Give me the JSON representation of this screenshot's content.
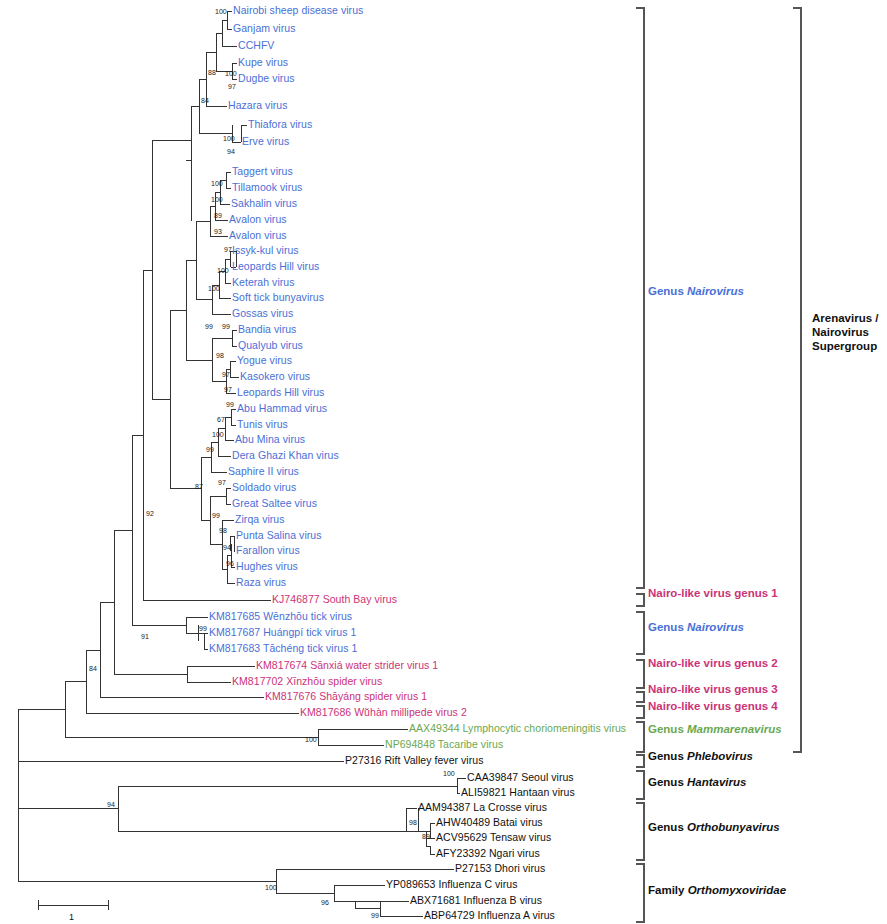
{
  "figure": {
    "type": "phylogenetic-tree",
    "scale_bar": {
      "label": "1",
      "x": 38,
      "y": 905,
      "width": 70
    }
  },
  "colors": {
    "nairovirus_blue": "#4a6fd6",
    "nairo_like_pink": "#cc3377",
    "mammarenavirus_green": "#6aa84f",
    "black": "#111111",
    "branch": "#333333",
    "bracket": "#555555"
  },
  "taxa": [
    {
      "label": "Nairobi sheep disease virus",
      "color": "nairovirus_blue",
      "x": 233,
      "y": 11
    },
    {
      "label": "Ganjam virus",
      "color": "nairovirus_blue",
      "x": 233,
      "y": 29
    },
    {
      "label": "CCHFV",
      "color": "nairovirus_blue",
      "x": 238,
      "y": 46
    },
    {
      "label": "Kupe virus",
      "color": "nairovirus_blue",
      "x": 238,
      "y": 63
    },
    {
      "label": "Dugbe virus",
      "color": "nairovirus_blue",
      "x": 238,
      "y": 79
    },
    {
      "label": "Hazara virus",
      "color": "nairovirus_blue",
      "x": 228,
      "y": 106
    },
    {
      "label": "Thiafora virus",
      "color": "nairovirus_blue",
      "x": 248,
      "y": 125
    },
    {
      "label": "Erve virus",
      "color": "nairovirus_blue",
      "x": 242,
      "y": 142
    },
    {
      "label": "Taggert virus",
      "color": "nairovirus_blue",
      "x": 232,
      "y": 172
    },
    {
      "label": "Tillamook virus",
      "color": "nairovirus_blue",
      "x": 232,
      "y": 188
    },
    {
      "label": "Sakhalin virus",
      "color": "nairovirus_blue",
      "x": 231,
      "y": 204
    },
    {
      "label": "Avalon virus",
      "color": "nairovirus_blue",
      "x": 229,
      "y": 220
    },
    {
      "label": "Avalon virus",
      "color": "nairovirus_blue",
      "x": 229,
      "y": 236
    },
    {
      "label": "Issyk-kul virus",
      "color": "nairovirus_blue",
      "x": 232,
      "y": 251
    },
    {
      "label": "Leopards Hill virus",
      "color": "nairovirus_blue",
      "x": 232,
      "y": 267
    },
    {
      "label": "Keterah virus",
      "color": "nairovirus_blue",
      "x": 232,
      "y": 283
    },
    {
      "label": "Soft tick bunyavirus",
      "color": "nairovirus_blue",
      "x": 232,
      "y": 298
    },
    {
      "label": "Gossas virus",
      "color": "nairovirus_blue",
      "x": 232,
      "y": 314
    },
    {
      "label": "Bandia virus",
      "color": "nairovirus_blue",
      "x": 238,
      "y": 330
    },
    {
      "label": "Qualyub virus",
      "color": "nairovirus_blue",
      "x": 238,
      "y": 346
    },
    {
      "label": "Yogue virus",
      "color": "nairovirus_blue",
      "x": 237,
      "y": 361
    },
    {
      "label": "Kasokero virus",
      "color": "nairovirus_blue",
      "x": 240,
      "y": 377
    },
    {
      "label": "Leopards Hill virus",
      "color": "nairovirus_blue",
      "x": 237,
      "y": 393
    },
    {
      "label": "Abu Hammad virus",
      "color": "nairovirus_blue",
      "x": 237,
      "y": 409
    },
    {
      "label": "Tunis virus",
      "color": "nairovirus_blue",
      "x": 237,
      "y": 425
    },
    {
      "label": "Abu Mina virus",
      "color": "nairovirus_blue",
      "x": 235,
      "y": 440
    },
    {
      "label": "Dera Ghazi Khan virus",
      "color": "nairovirus_blue",
      "x": 232,
      "y": 456
    },
    {
      "label": "Saphire II virus",
      "color": "nairovirus_blue",
      "x": 228,
      "y": 472
    },
    {
      "label": "Soldado virus",
      "color": "nairovirus_blue",
      "x": 232,
      "y": 488
    },
    {
      "label": "Great Saltee virus",
      "color": "nairovirus_blue",
      "x": 232,
      "y": 504
    },
    {
      "label": "Zirqa virus",
      "color": "nairovirus_blue",
      "x": 235,
      "y": 520
    },
    {
      "label": "Punta Salina virus",
      "color": "nairovirus_blue",
      "x": 236,
      "y": 536
    },
    {
      "label": "Farallon virus",
      "color": "nairovirus_blue",
      "x": 236,
      "y": 551
    },
    {
      "label": "Hughes virus",
      "color": "nairovirus_blue",
      "x": 236,
      "y": 567
    },
    {
      "label": "Raza virus",
      "color": "nairovirus_blue",
      "x": 236,
      "y": 583
    },
    {
      "label": "KJ746877 South Bay virus",
      "color": "nairo_like_pink",
      "x": 272,
      "y": 600
    },
    {
      "label": "KM817685 Wēnzhōu tick virus",
      "color": "nairovirus_blue",
      "x": 209,
      "y": 617
    },
    {
      "label": "KM817687 Huángpí tick virus 1",
      "color": "nairovirus_blue",
      "x": 209,
      "y": 633
    },
    {
      "label": "KM817683 Tāchéng tick virus 1",
      "color": "nairovirus_blue",
      "x": 209,
      "y": 649
    },
    {
      "label": "KM817674 Sānxiá water strider virus 1",
      "color": "nairo_like_pink",
      "x": 256,
      "y": 666
    },
    {
      "label": "KM817702 Xīnzhōu spider virus",
      "color": "nairo_like_pink",
      "x": 232,
      "y": 682
    },
    {
      "label": "KM817676 Shāyáng spider virus 1",
      "color": "nairo_like_pink",
      "x": 265,
      "y": 697
    },
    {
      "label": "KM817686 Wŭhàn millipede virus 2",
      "color": "nairo_like_pink",
      "x": 300,
      "y": 713
    },
    {
      "label": "AAX49344 Lymphocytic choriomeningitis virus",
      "color": "mammarenavirus_green",
      "x": 409,
      "y": 729
    },
    {
      "label": "NP694848 Tacaribe virus",
      "color": "mammarenavirus_green",
      "x": 385,
      "y": 745
    },
    {
      "label": "P27316 Rift Valley fever virus",
      "color": "black",
      "x": 345,
      "y": 761
    },
    {
      "label": "CAA39847 Seoul virus",
      "color": "black",
      "x": 467,
      "y": 778
    },
    {
      "label": "ALI59821 Hantaan virus",
      "color": "black",
      "x": 461,
      "y": 793
    },
    {
      "label": "AAM94387 La Crosse virus",
      "color": "black",
      "x": 418,
      "y": 808
    },
    {
      "label": "AHW40489 Batai virus",
      "color": "black",
      "x": 436,
      "y": 823
    },
    {
      "label": "ACV95629 Tensaw virus",
      "color": "black",
      "x": 436,
      "y": 838
    },
    {
      "label": "AFY23392 Ngari virus",
      "color": "black",
      "x": 436,
      "y": 854
    },
    {
      "label": "P27153 Dhori virus",
      "color": "black",
      "x": 455,
      "y": 869
    },
    {
      "label": "YP089653 Influenza C virus",
      "color": "black",
      "x": 386,
      "y": 885
    },
    {
      "label": "ABX71681 Influenza B virus",
      "color": "black",
      "x": 410,
      "y": 901
    },
    {
      "label": "ABP64729 Influenza A virus",
      "color": "black",
      "x": 424,
      "y": 916
    }
  ],
  "bootstrap_values": [
    {
      "value": "100",
      "x": 215,
      "y": 12
    },
    {
      "value": "88",
      "x": 208,
      "y": 73
    },
    {
      "value": "100",
      "x": 225,
      "y": 74
    },
    {
      "value": "97",
      "x": 228,
      "y": 87
    },
    {
      "value": "84",
      "x": 201,
      "y": 101
    },
    {
      "value": "100",
      "x": 223,
      "y": 139
    },
    {
      "value": "94",
      "x": 227,
      "y": 152
    },
    {
      "value": "100",
      "x": 211,
      "y": 184
    },
    {
      "value": "100",
      "x": 211,
      "y": 200
    },
    {
      "value": "89",
      "x": 214,
      "y": 216
    },
    {
      "value": "93",
      "x": 214,
      "y": 232
    },
    {
      "value": "97",
      "x": 224,
      "y": 250
    },
    {
      "value": "100",
      "x": 217,
      "y": 271
    },
    {
      "value": "100",
      "x": 208,
      "y": 289
    },
    {
      "value": "99",
      "x": 205,
      "y": 327
    },
    {
      "value": "99",
      "x": 222,
      "y": 327
    },
    {
      "value": "98",
      "x": 216,
      "y": 356
    },
    {
      "value": "97",
      "x": 222,
      "y": 375
    },
    {
      "value": "97",
      "x": 224,
      "y": 390
    },
    {
      "value": "99",
      "x": 226,
      "y": 405
    },
    {
      "value": "67",
      "x": 217,
      "y": 420
    },
    {
      "value": "100",
      "x": 212,
      "y": 435
    },
    {
      "value": "99",
      "x": 206,
      "y": 450
    },
    {
      "value": "87",
      "x": 195,
      "y": 487
    },
    {
      "value": "97",
      "x": 218,
      "y": 483
    },
    {
      "value": "92",
      "x": 146,
      "y": 514
    },
    {
      "value": "99",
      "x": 212,
      "y": 516
    },
    {
      "value": "98",
      "x": 219,
      "y": 531
    },
    {
      "value": "94",
      "x": 223,
      "y": 548
    },
    {
      "value": "96",
      "x": 226,
      "y": 564
    },
    {
      "value": "91",
      "x": 141,
      "y": 637
    },
    {
      "value": "99",
      "x": 199,
      "y": 629
    },
    {
      "value": "84",
      "x": 89,
      "y": 669
    },
    {
      "value": "100",
      "x": 305,
      "y": 740
    },
    {
      "value": "100",
      "x": 443,
      "y": 774
    },
    {
      "value": "98",
      "x": 409,
      "y": 823
    },
    {
      "value": "89",
      "x": 422,
      "y": 837
    },
    {
      "value": "94",
      "x": 107,
      "y": 805
    },
    {
      "value": "100",
      "x": 265,
      "y": 888
    },
    {
      "value": "96",
      "x": 321,
      "y": 903
    },
    {
      "value": "99",
      "x": 371,
      "y": 916
    }
  ],
  "group_labels": [
    {
      "prefix": "Genus ",
      "name": "Nairovirus",
      "italic": true,
      "color": "nairovirus_blue",
      "x": 648,
      "y": 292
    },
    {
      "prefix": "",
      "name": "Nairo-like virus genus 1",
      "italic": false,
      "color": "nairo_like_pink",
      "x": 648,
      "y": 594
    },
    {
      "prefix": "Genus ",
      "name": "Nairovirus",
      "italic": true,
      "color": "nairovirus_blue",
      "x": 648,
      "y": 628
    },
    {
      "prefix": "",
      "name": "Nairo-like virus genus 2",
      "italic": false,
      "color": "nairo_like_pink",
      "x": 648,
      "y": 664
    },
    {
      "prefix": "",
      "name": "Nairo-like virus genus 3",
      "italic": false,
      "color": "nairo_like_pink",
      "x": 648,
      "y": 690
    },
    {
      "prefix": "",
      "name": "Nairo-like virus genus 4",
      "italic": false,
      "color": "nairo_like_pink",
      "x": 648,
      "y": 707
    },
    {
      "prefix": "Genus ",
      "name": "Mammarenavirus",
      "italic": true,
      "color": "mammarenavirus_green",
      "x": 648,
      "y": 730
    },
    {
      "prefix": "Genus ",
      "name": "Phlebovirus",
      "italic": true,
      "color": "black",
      "x": 648,
      "y": 757
    },
    {
      "prefix": "Genus ",
      "name": "Hantavirus",
      "italic": true,
      "color": "black",
      "x": 648,
      "y": 783
    },
    {
      "prefix": "Genus ",
      "name": "Orthobunyavirus",
      "italic": true,
      "color": "black",
      "x": 648,
      "y": 828
    },
    {
      "prefix": "Family ",
      "name": "Orthomyxoviridae",
      "italic": true,
      "color": "black",
      "x": 648,
      "y": 891
    }
  ],
  "supergroup_label": {
    "text": "Arenavirus /\nNairovirus\nSupergroup",
    "x": 812,
    "y": 332,
    "color": "black"
  }
}
